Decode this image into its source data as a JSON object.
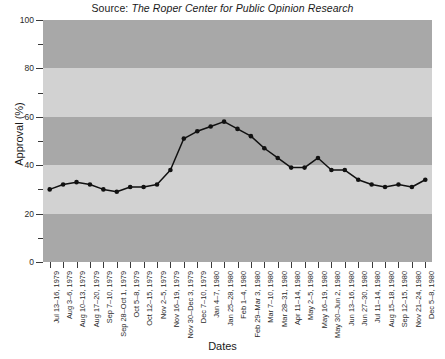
{
  "title": {
    "prefix": "Source:",
    "source_name": "The Roper Center for Public Opinion Research"
  },
  "axes": {
    "ylabel": "Approval (%)",
    "xlabel": "Dates",
    "y_major_ticks": [
      "0",
      "20",
      "40",
      "60",
      "80",
      "100"
    ],
    "y_minor_ticks": [
      "10",
      "30",
      "50",
      "70",
      "90"
    ]
  },
  "colors": {
    "band_dark": "#a8a8a8",
    "band_light": "#d2d2d2",
    "line": "#111111",
    "marker": "#111111",
    "axis": "#3a3a3a",
    "text": "#1a1a1a"
  },
  "chart_data": {
    "type": "line",
    "title": "Source: The Roper Center for Public Opinion Research",
    "xlabel": "Dates",
    "ylabel": "Approval (%)",
    "ylim": [
      0,
      100
    ],
    "grid": false,
    "legend": null,
    "categories": [
      "Jul 13–16, 1979",
      "Aug 3–6, 1979",
      "Aug 10–13, 1979",
      "Aug 17–20, 1979",
      "Sep 7–10, 1979",
      "Sep 28–Oct 1, 1979",
      "Oct 5–8, 1979",
      "Oct 12–15, 1979",
      "Nov 2–5, 1979",
      "Nov 16–19, 1979",
      "Nov 30–Dec 3, 1979",
      "Dec 7–10, 1979",
      "Jan 4–7, 1980",
      "Jan 25–28, 1980",
      "Feb 1–4, 1980",
      "Feb 29–Mar 3, 1980",
      "Mar 7–10, 1980",
      "Mar 28–31, 1980",
      "Apr 11–14, 1980",
      "May 2–5, 1980",
      "May 16–19, 1980",
      "May 30–Jun 2, 1980",
      "Jun 13–16, 1980",
      "Jun 27–30, 1980",
      "Jul 11–14, 1980",
      "Aug 15–18, 1980",
      "Sep 12–15, 1980",
      "Nov 21–24, 1980",
      "Dec 5–8, 1980"
    ],
    "values": [
      30,
      32,
      33,
      32,
      30,
      29,
      31,
      31,
      32,
      38,
      51,
      54,
      56,
      58,
      55,
      52,
      47,
      43,
      39,
      39,
      43,
      38,
      38,
      34,
      32,
      31,
      32,
      31,
      34
    ],
    "series": [
      {
        "name": "Presidential approval",
        "values": [
          30,
          32,
          33,
          32,
          30,
          29,
          31,
          31,
          32,
          38,
          51,
          54,
          56,
          58,
          55,
          52,
          47,
          43,
          39,
          39,
          43,
          38,
          38,
          34,
          32,
          31,
          32,
          31,
          34
        ]
      }
    ],
    "bands": [
      {
        "from": 0,
        "to": 20,
        "shade": "dark"
      },
      {
        "from": 20,
        "to": 40,
        "shade": "light"
      },
      {
        "from": 40,
        "to": 60,
        "shade": "dark"
      },
      {
        "from": 60,
        "to": 80,
        "shade": "light"
      },
      {
        "from": 80,
        "to": 100,
        "shade": "dark"
      }
    ]
  }
}
